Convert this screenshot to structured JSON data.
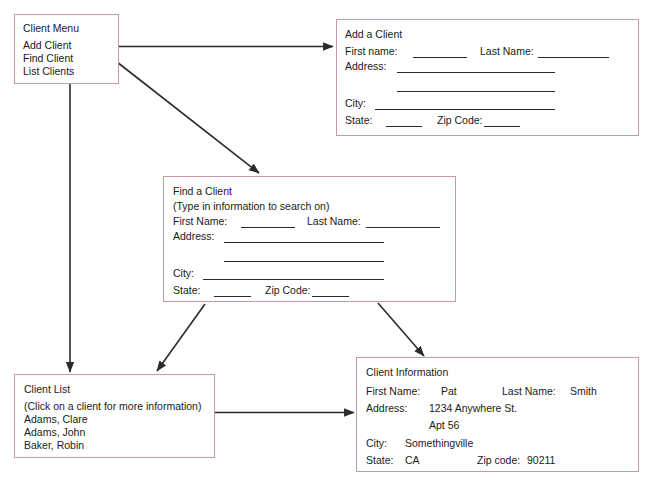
{
  "diagram": {
    "border_color": "#c79a9e",
    "line_color": "#2a2a2a",
    "background": "#ffffff"
  },
  "client_menu": {
    "title": "Client Menu",
    "items": [
      {
        "label": "Add Client"
      },
      {
        "label": "Find Client"
      },
      {
        "label": "List Clients"
      }
    ]
  },
  "add_client": {
    "title": "Add a Client",
    "fields": {
      "first_name": "First name:",
      "last_name": "Last Name:",
      "address": "Address:",
      "city": "City:",
      "state": "State:",
      "zip_code": "Zip Code:"
    }
  },
  "find_client": {
    "title": "Find a Client",
    "note": "(Type in information to search on)",
    "fields": {
      "first_name": "First Name:",
      "last_name": "Last Name:",
      "address": "Address:",
      "city": "City:",
      "state": "State:",
      "zip_code": "Zip Code:"
    }
  },
  "client_list": {
    "title": "Client List",
    "note": "(Click on a client for more information)",
    "entries": [
      {
        "name": "Adams, Clare"
      },
      {
        "name": "Adams, John"
      },
      {
        "name": "Baker, Robin"
      }
    ]
  },
  "client_information": {
    "title": "Client Information",
    "fields": {
      "first_name": "First Name:",
      "last_name": "Last Name:",
      "address": "Address:",
      "city": "City:",
      "state": "State:",
      "zip_code": "Zip code:"
    },
    "values": {
      "first_name": "Pat",
      "last_name": "Smith",
      "address_line1": "1234 Anywhere St.",
      "address_line2": "Apt 56",
      "city": "Somethingville",
      "state": "CA",
      "zip_code": "90211"
    }
  }
}
